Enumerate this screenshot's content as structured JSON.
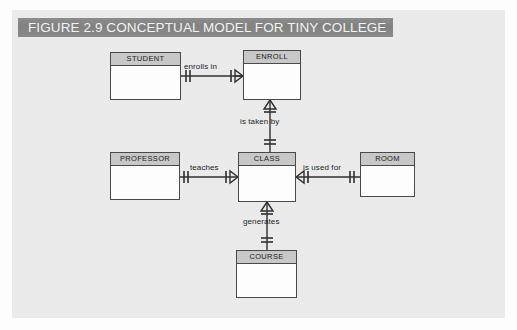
{
  "figure": {
    "banner_title": "FIGURE 2.9  CONCEPTUAL MODEL FOR TINY COLLEGE",
    "panel_background": "#ececed",
    "banner_color": "#868686",
    "banner_text_color": "#f4f4f4",
    "line_color": "#303030",
    "entity_header_color": "#c9c9c9",
    "entity_body_color": "#ffffff",
    "entity_border_color": "#4a4a4a"
  },
  "diagram": {
    "type": "erd-crows-foot",
    "entities": [
      {
        "id": "student",
        "label": "STUDENT",
        "x": 110,
        "y": 52,
        "w": 71,
        "h": 48
      },
      {
        "id": "enroll",
        "label": "ENROLL",
        "x": 243,
        "y": 50,
        "w": 58,
        "h": 50
      },
      {
        "id": "professor",
        "label": "PROFESSOR",
        "x": 110,
        "y": 152,
        "w": 70,
        "h": 48
      },
      {
        "id": "class",
        "label": "CLASS",
        "x": 238,
        "y": 152,
        "w": 58,
        "h": 50
      },
      {
        "id": "room",
        "label": "ROOM",
        "x": 360,
        "y": 152,
        "w": 55,
        "h": 45
      },
      {
        "id": "course",
        "label": "COURSE",
        "x": 236,
        "y": 250,
        "w": 61,
        "h": 48
      }
    ],
    "relationships": [
      {
        "id": "enrolls-in",
        "label": "enrolls in",
        "from": "student",
        "to": "enroll",
        "from_cardinality": "one-and-only-one",
        "to_cardinality": "many",
        "orientation": "horizontal",
        "label_x": 184,
        "label_y": 68
      },
      {
        "id": "is-taken-by",
        "label": "is taken by",
        "from": "enroll",
        "to": "class",
        "from_cardinality": "many",
        "to_cardinality": "one-and-only-one",
        "orientation": "vertical",
        "label_x": 240,
        "label_y": 122
      },
      {
        "id": "teaches",
        "label": "teaches",
        "from": "professor",
        "to": "class",
        "from_cardinality": "one-and-only-one",
        "to_cardinality": "many",
        "orientation": "horizontal",
        "label_x": 186,
        "label_y": 168
      },
      {
        "id": "is-used-for",
        "label": "is used for",
        "from": "class",
        "to": "room",
        "from_cardinality": "many",
        "to_cardinality": "one-and-only-one",
        "orientation": "horizontal",
        "label_x": 303,
        "label_y": 168
      },
      {
        "id": "generates",
        "label": "generates",
        "from": "class",
        "to": "course",
        "from_cardinality": "many",
        "to_cardinality": "one-and-only-one",
        "orientation": "vertical",
        "label_x": 243,
        "label_y": 222
      }
    ]
  }
}
